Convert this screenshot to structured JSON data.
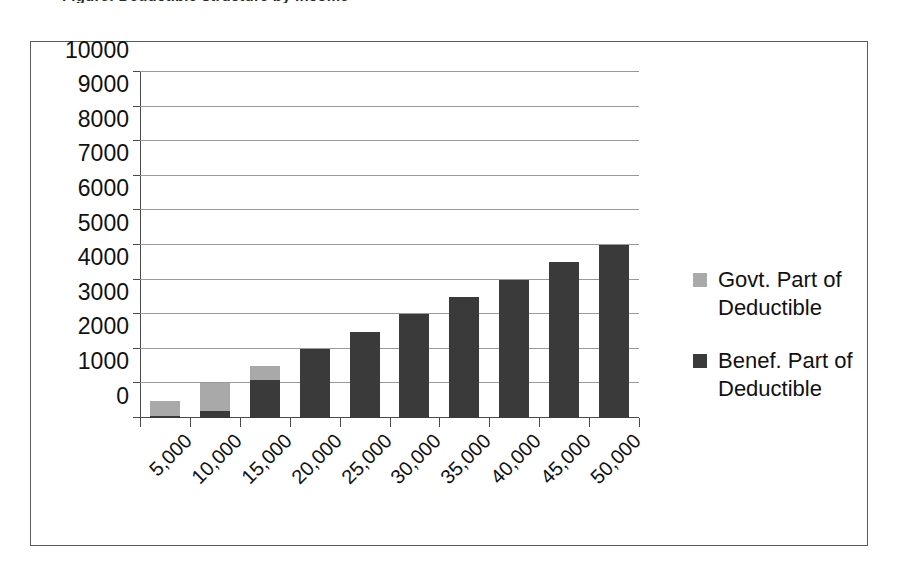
{
  "caption": {
    "sliver_text": "Figure: Deductible structure by income"
  },
  "chart_data": {
    "type": "bar",
    "subtype": "stacked",
    "title": "",
    "xlabel": "",
    "ylabel": "",
    "categories": [
      "5,000",
      "10,000",
      "15,000",
      "20,000",
      "25,000",
      "30,000",
      "35,000",
      "40,000",
      "45,000",
      "50,000"
    ],
    "series": [
      {
        "name": "Benef. Part of Deductible",
        "color": "#3a3a3a",
        "values": [
          50,
          200,
          1100,
          2000,
          2500,
          3000,
          3500,
          4000,
          4500,
          5000
        ]
      },
      {
        "name": "Govt. Part of Deductible",
        "color": "#a9a9a9",
        "values": [
          450,
          800,
          400,
          0,
          0,
          0,
          0,
          0,
          0,
          0
        ]
      }
    ],
    "totals": [
      500,
      1000,
      1500,
      2000,
      2500,
      3000,
      3500,
      4000,
      4500,
      5000
    ],
    "ylim": [
      0,
      10000
    ],
    "ytick_step": 1000,
    "yticks": [
      "0",
      "1000",
      "2000",
      "3000",
      "4000",
      "5000",
      "6000",
      "7000",
      "8000",
      "9000",
      "10000"
    ],
    "grid": true,
    "legend_position": "right",
    "x_label_rotation": -45
  },
  "legend": {
    "entries": [
      {
        "label": "Govt. Part of Deductible",
        "color": "#a9a9a9"
      },
      {
        "label": "Benef. Part of Deductible",
        "color": "#3a3a3a"
      }
    ]
  }
}
